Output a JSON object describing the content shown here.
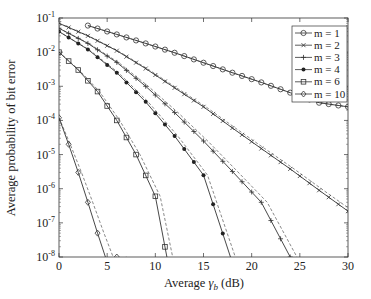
{
  "chart_data": {
    "type": "line",
    "title": "",
    "xlabel": "Average γ_b (dB)",
    "ylabel": "Average probability of bit error",
    "xlim": [
      0,
      30
    ],
    "ylim": [
      1e-08,
      0.1
    ],
    "yscale": "log",
    "grid": false,
    "legend_position": "upper right",
    "xticks": [
      0,
      5,
      10,
      15,
      20,
      25,
      30
    ],
    "yticks": [
      "10^-1",
      "10^-2",
      "10^-3",
      "10^-4",
      "10^-5",
      "10^-6",
      "10^-7",
      "10^-8"
    ],
    "legend": [
      "m = 1",
      "m = 2",
      "m = 3",
      "m = 4",
      "m = 6",
      "m = 10"
    ],
    "note": "Solid lines with markers = exact; dashed lines = approximation (values estimated from plot)",
    "series": [
      {
        "name": "m = 1",
        "marker": "circle",
        "style": "solid",
        "x": [
          3,
          6,
          9,
          12,
          15,
          18,
          21,
          24,
          27,
          30
        ],
        "y": [
          0.06,
          0.033,
          0.018,
          0.0096,
          0.0049,
          0.0025,
          0.0013,
          0.00065,
          0.00033,
          0.00025
        ]
      },
      {
        "name": "m = 2",
        "marker": "x",
        "style": "solid",
        "x": [
          0,
          3,
          6,
          9,
          12,
          15,
          18,
          21,
          24,
          27,
          30
        ],
        "y": [
          0.07,
          0.03,
          0.011,
          0.0033,
          0.0009,
          0.00025,
          6e-05,
          1.5e-05,
          3.8e-06,
          9e-07,
          2.2e-07
        ]
      },
      {
        "name": "m = 3",
        "marker": "plus",
        "style": "solid",
        "x": [
          0,
          3,
          6,
          9,
          12,
          15,
          18,
          21,
          24
        ],
        "y": [
          0.05,
          0.018,
          0.005,
          0.001,
          0.00017,
          2.5e-05,
          3.2e-06,
          4e-07,
          1e-08
        ]
      },
      {
        "name": "m = 4",
        "marker": "dot",
        "style": "solid",
        "x": [
          0,
          3,
          6,
          9,
          12,
          15,
          17.8
        ],
        "y": [
          0.04,
          0.012,
          0.0025,
          0.00035,
          3.5e-05,
          2.5e-06,
          1e-08
        ]
      },
      {
        "name": "m = 6",
        "marker": "square",
        "style": "solid",
        "x": [
          0,
          2,
          4,
          6,
          8,
          10,
          11.2
        ],
        "y": [
          0.01,
          0.003,
          0.0007,
          0.0001,
          1e-05,
          6e-07,
          1e-08
        ]
      },
      {
        "name": "m = 10",
        "marker": "diamond",
        "style": "solid",
        "x": [
          0,
          1,
          2,
          3,
          4,
          5,
          6
        ],
        "y": [
          0.00012,
          2e-05,
          3e-06,
          4e-07,
          5e-08,
          7e-09,
          1e-08
        ]
      }
    ]
  }
}
